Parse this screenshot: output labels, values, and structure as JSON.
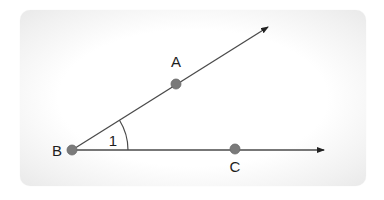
{
  "diagram": {
    "type": "angle",
    "colors": {
      "line": "#4a4a4a",
      "point_fill": "#7a7a7a",
      "point_stroke": "#6a6a6a",
      "label": "#1e1e1e",
      "card_bg": "#ffffff",
      "card_edge": "#e9e9e9"
    },
    "points": [
      {
        "id": "A",
        "label": "A",
        "x": 176,
        "y": 84,
        "label_x": 176,
        "label_y": 67
      },
      {
        "id": "B",
        "label": "B",
        "x": 72,
        "y": 150,
        "label_x": 57,
        "label_y": 156
      },
      {
        "id": "C",
        "label": "C",
        "x": 235,
        "y": 149,
        "label_x": 235,
        "label_y": 172
      }
    ],
    "rays": [
      {
        "id": "ray-BA",
        "from": "B",
        "through": "A",
        "end_x": 268,
        "end_y": 27
      },
      {
        "id": "ray-BC",
        "from": "B",
        "through": "C",
        "end_x": 324,
        "end_y": 150
      }
    ],
    "angle_marks": [
      {
        "id": "angle-1",
        "label": "1",
        "vertex": "B",
        "radius": 57,
        "label_x": 113,
        "label_y": 146
      }
    ]
  }
}
